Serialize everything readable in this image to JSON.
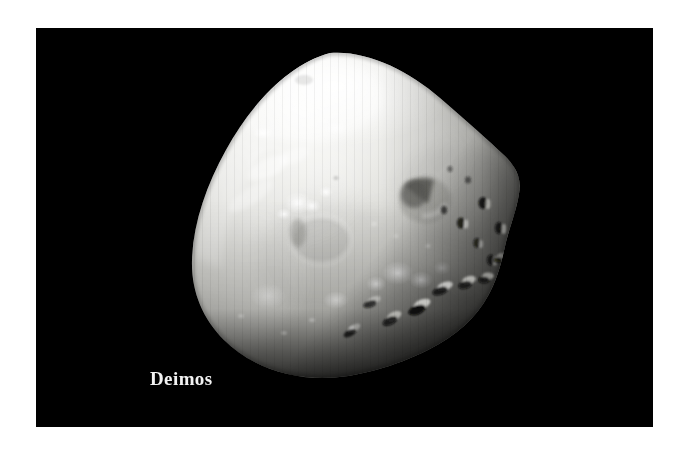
{
  "page": {
    "background_color": "#ffffff",
    "width": 689,
    "height": 450
  },
  "photo": {
    "name": "deimos-photograph",
    "frame_color": "#000000",
    "frame_rect": {
      "x": 36,
      "y": 28,
      "width": 617,
      "height": 399
    },
    "caption": "Deimos",
    "caption_color": "#f2f2f2",
    "subject": {
      "name": "Deimos",
      "type": "moon",
      "parent_body": "Mars",
      "silhouette": "rounded-triangular",
      "surface_color_bright": "#f5f5f3",
      "surface_color_mid": "#c8c8c4",
      "surface_color_shadow": "#4a4a48",
      "illumination": "lit from upper-left, terminator at lower-right",
      "features": [
        {
          "label": "bright-north-pole-region",
          "kind": "highlight"
        },
        {
          "label": "large-crater-right-of-center",
          "kind": "crater"
        },
        {
          "label": "bright-ejecta-spots-upper-left",
          "kind": "highlight"
        },
        {
          "label": "subdued-crater-ring-center-left",
          "kind": "crater"
        },
        {
          "label": "rugged-terminator-craters-lower-right",
          "kind": "crater-field"
        },
        {
          "label": "smooth-limb-left",
          "kind": "limb"
        }
      ]
    }
  }
}
